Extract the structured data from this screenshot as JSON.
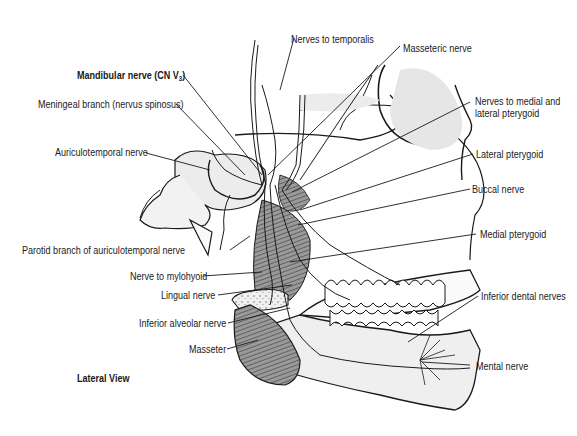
{
  "figure": {
    "view": "Lateral View",
    "title_label": {
      "text": "Mandibular nerve (CN V",
      "subscript": "3",
      "suffix": ")"
    },
    "labels": {
      "nerves_to_temporalis": "Nerves to temporalis",
      "masseteric_nerve": "Masseteric nerve",
      "meningeal_branch": "Meningeal branch (nervus spinosus)",
      "nerves_to_medial_lateral_pterygoid_1": "Nerves to medial and",
      "nerves_to_medial_lateral_pterygoid_2": "lateral pterygoid",
      "auriculotemporal_nerve": "Auriculotemporal nerve",
      "lateral_pterygoid": "Lateral pterygoid",
      "buccal_nerve": "Buccal nerve",
      "parotid_branch": "Parotid branch of auriculotemporal nerve",
      "medial_pterygoid": "Medial pterygoid",
      "nerve_to_mylohyoid": "Nerve to mylohyoid",
      "lingual_nerve": "Lingual nerve",
      "inferior_dental_nerves": "Inferior dental nerves",
      "inferior_alveolar_nerve": "Inferior alveolar nerve",
      "masseter": "Masseter",
      "mental_nerve": "Mental nerve"
    },
    "colors": {
      "ink": "#1a1a1a",
      "shade": "#d9d9d9",
      "muscle": "#8a8a8a"
    }
  }
}
